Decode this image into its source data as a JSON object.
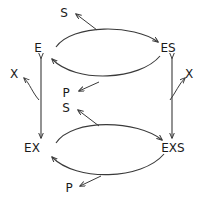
{
  "diagram": {
    "background_color": "#ffffff",
    "stroke_color": "#3a3a3a",
    "text_color": "#1a1a1a",
    "nodes": [
      {
        "id": "E",
        "label": "E",
        "x": 38,
        "y": 48
      },
      {
        "id": "ES",
        "label": "ES",
        "x": 168,
        "y": 48
      },
      {
        "id": "EX",
        "label": "EX",
        "x": 32,
        "y": 148
      },
      {
        "id": "EXS",
        "label": "EXS",
        "x": 173,
        "y": 148
      }
    ],
    "species": [
      {
        "id": "S-top",
        "label": "S",
        "x": 64,
        "y": 13
      },
      {
        "id": "X-left",
        "label": "X",
        "x": 14,
        "y": 74
      },
      {
        "id": "X-right",
        "label": "X",
        "x": 189,
        "y": 74
      },
      {
        "id": "P-middle",
        "label": "P",
        "x": 66,
        "y": 93
      },
      {
        "id": "S-middle",
        "label": "S",
        "x": 66,
        "y": 108
      },
      {
        "id": "P-bottom",
        "label": "P",
        "x": 69,
        "y": 188
      }
    ],
    "edges": [
      {
        "id": "E-to-ES",
        "from": "E",
        "to": "ES",
        "kind": "curve-upper",
        "direction": "forward"
      },
      {
        "id": "ES-to-E",
        "from": "ES",
        "to": "E",
        "kind": "curve-lower",
        "direction": "reverse"
      },
      {
        "id": "EX-to-EXS",
        "from": "EX",
        "to": "EXS",
        "kind": "curve-upper",
        "direction": "forward"
      },
      {
        "id": "EXS-to-EX",
        "from": "EXS",
        "to": "EX",
        "kind": "curve-lower",
        "direction": "reverse"
      },
      {
        "id": "E-EX",
        "from": "E",
        "to": "EX",
        "kind": "vertical",
        "direction": "bidirectional"
      },
      {
        "id": "ES-EXS",
        "from": "ES",
        "to": "EXS",
        "kind": "vertical",
        "direction": "bidirectional"
      },
      {
        "id": "S-in-top",
        "from": "curve",
        "to": "S-top",
        "kind": "branch",
        "direction": "forward"
      },
      {
        "id": "P-out-top",
        "from": "curve",
        "to": "P-middle",
        "kind": "branch",
        "direction": "forward"
      },
      {
        "id": "S-in-bot",
        "from": "curve",
        "to": "S-middle",
        "kind": "branch",
        "direction": "forward"
      },
      {
        "id": "P-out-bot",
        "from": "curve",
        "to": "P-bottom",
        "kind": "branch",
        "direction": "forward"
      },
      {
        "id": "X-out-left",
        "from": "E-EX",
        "to": "X-left",
        "kind": "branch",
        "direction": "forward"
      },
      {
        "id": "X-out-right",
        "from": "ES-EXS",
        "to": "X-right",
        "kind": "branch",
        "direction": "forward"
      }
    ]
  }
}
